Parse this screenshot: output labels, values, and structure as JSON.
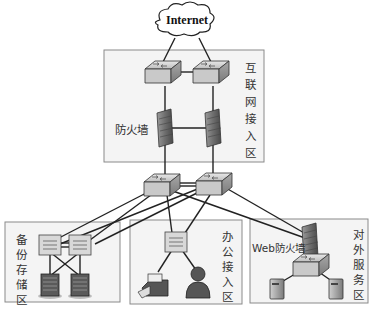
{
  "cloud": {
    "label": "Internet",
    "icon": "cloud-icon"
  },
  "zones": {
    "internet_access": {
      "label_chars": [
        "互",
        "联",
        "网",
        "接",
        "入",
        "区"
      ],
      "firewall_label": "防火墙"
    },
    "backup_storage": {
      "label_chars": [
        "备",
        "份",
        "存",
        "储",
        "区"
      ]
    },
    "office_access": {
      "label_chars": [
        "办",
        "公",
        "接",
        "入",
        "区"
      ]
    },
    "external_service": {
      "label_chars": [
        "对",
        "外",
        "服",
        "务",
        "区"
      ],
      "firewall_label": "Web防火墙"
    }
  },
  "devices": {
    "internet_switches": [
      "switch-icon",
      "switch-icon"
    ],
    "internet_firewalls": [
      "firewall-icon",
      "firewall-icon"
    ],
    "core_switches": [
      "switch-icon",
      "switch-icon"
    ],
    "backup_switches": [
      "switch-icon",
      "switch-icon"
    ],
    "backup_storage": [
      "storage-server-icon",
      "storage-server-icon"
    ],
    "office_switch": "switch-icon",
    "office_endpoints": [
      "printer-icon",
      "user-icon"
    ],
    "web_firewall": "firewall-icon",
    "service_switch": "switch-icon",
    "service_servers": [
      "server-icon",
      "server-icon"
    ]
  }
}
